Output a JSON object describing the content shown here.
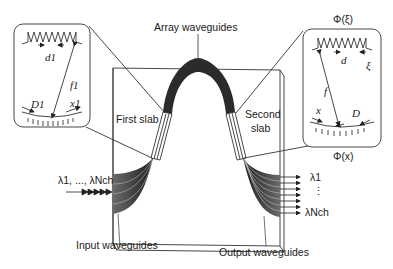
{
  "diagram": {
    "labels": {
      "array_waveguides": "Array waveguides",
      "first_slab": "First slab",
      "second_slab_line1": "Second",
      "second_slab_line2": "slab",
      "input_waveguides": "Input waveguides",
      "output_waveguides": "Output waveguides",
      "input_wavelengths": "λ1, ..., λNch",
      "output_lambda_first": "λ1",
      "output_dots": "⋮",
      "output_lambda_last": "λNch",
      "phi_xi": "Φ(ξ)",
      "phi_x": "Φ(x)"
    },
    "left_inset": {
      "d": "d1",
      "f": "f1",
      "D": "D1",
      "x": "x1"
    },
    "right_inset": {
      "d": "d",
      "xi": "ξ",
      "f": "f",
      "x": "x",
      "D": "D"
    },
    "colors": {
      "line": "#2a2a2a",
      "waveguide_fill": "#2b2b2b",
      "waveguide_gradient_light": "#8a8a8a"
    }
  }
}
